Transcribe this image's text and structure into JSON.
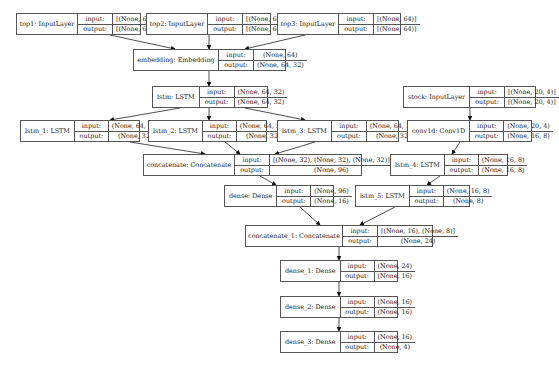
{
  "diagram": {
    "title": "",
    "labels": {
      "input": "input:",
      "output": "output:"
    },
    "nodes": [
      {
        "id": "top1",
        "name": "top1: InputLayer",
        "input": "[(None, 64)]",
        "output": "[(None, 64)]",
        "x": 16,
        "y": 13,
        "w": 125,
        "h": 22,
        "nw": 52,
        "lw": 28
      },
      {
        "id": "top2",
        "name": "top2: InputLayer",
        "input": "[(None, 64)]",
        "output": "[(None, 64)]",
        "x": 146,
        "y": 13,
        "w": 125,
        "h": 22,
        "nw": 52,
        "lw": 28
      },
      {
        "id": "top3",
        "name": "top3: InputLayer",
        "input": "[(None, 64)]",
        "output": "[(None, 64)]",
        "x": 277,
        "y": 13,
        "w": 124,
        "h": 22,
        "nw": 52,
        "lw": 28
      },
      {
        "id": "embedding",
        "name": "embedding: Embedding",
        "input": "(None, 64)",
        "output": "(None, 64, 32)",
        "x": 133,
        "y": 49,
        "w": 153,
        "h": 22,
        "nw": 76,
        "lw": 28
      },
      {
        "id": "lstm",
        "name": "lstm: LSTM",
        "input": "(None, 64, 32)",
        "output": "(None, 64, 32)",
        "x": 152,
        "y": 86,
        "w": 116,
        "h": 22,
        "nw": 39,
        "lw": 28
      },
      {
        "id": "lstm_1",
        "name": "lstm_1: LSTM",
        "input": "(None, 64, 32)",
        "output": "(None, 32)",
        "x": 20,
        "y": 120,
        "w": 120,
        "h": 22,
        "nw": 46,
        "lw": 27
      },
      {
        "id": "lstm_2",
        "name": "lstm_2: LSTM",
        "input": "(None, 64, 32)",
        "output": "(None, 32)",
        "x": 148,
        "y": 120,
        "w": 119,
        "h": 22,
        "nw": 46,
        "lw": 27
      },
      {
        "id": "lstm_3",
        "name": "lstm_3: LSTM",
        "input": "(None, 64, 32)",
        "output": "(None, 32)",
        "x": 277,
        "y": 120,
        "w": 122,
        "h": 22,
        "nw": 46,
        "lw": 28
      },
      {
        "id": "stock",
        "name": "stock: InputLayer",
        "input": "[(None, 20, 4)]",
        "output": "[(None, 20, 4)]",
        "x": 403,
        "y": 86,
        "w": 133,
        "h": 22,
        "nw": 57,
        "lw": 28
      },
      {
        "id": "conv1d",
        "name": "conv1d: Conv1D",
        "input": "(None, 20, 4)",
        "output": "(None, 16, 8)",
        "x": 407,
        "y": 120,
        "w": 125,
        "h": 22,
        "nw": 55,
        "lw": 27
      },
      {
        "id": "concatenate",
        "name": "concatenate: Concatenate",
        "input": "[(None, 32), (None, 32), (None, 32)]",
        "output": "(None, 96)",
        "x": 143,
        "y": 154,
        "w": 219,
        "h": 22,
        "nw": 82,
        "lw": 28
      },
      {
        "id": "lstm_4",
        "name": "lstm_4: LSTM",
        "input": "(None, 16, 8)",
        "output": "(None, 16, 8)",
        "x": 390,
        "y": 154,
        "w": 118,
        "h": 22,
        "nw": 46,
        "lw": 27
      },
      {
        "id": "dense",
        "name": "dense: Dense",
        "input": "(None, 96)",
        "output": "(None, 16)",
        "x": 224,
        "y": 185,
        "w": 110,
        "h": 22,
        "nw": 46,
        "lw": 27
      },
      {
        "id": "lstm_5",
        "name": "lstm_5: LSTM",
        "input": "(None, 16, 8)",
        "output": "(None, 8)",
        "x": 355,
        "y": 185,
        "w": 115,
        "h": 22,
        "nw": 46,
        "lw": 27
      },
      {
        "id": "concatenate_1",
        "name": "concatenate_1: Concatenate",
        "input": "[(None, 16), (None, 8)]",
        "output": "(None, 24)",
        "x": 245,
        "y": 225,
        "w": 188,
        "h": 22,
        "nw": 88,
        "lw": 28
      },
      {
        "id": "dense_1",
        "name": "dense_1: Dense",
        "input": "(None, 24)",
        "output": "(None, 16)",
        "x": 280,
        "y": 260,
        "w": 118,
        "h": 22,
        "nw": 53,
        "lw": 27
      },
      {
        "id": "dense_2",
        "name": "dense_2: Dense",
        "input": "(None, 16)",
        "output": "(None, 16)",
        "x": 280,
        "y": 296,
        "w": 118,
        "h": 22,
        "nw": 53,
        "lw": 27
      },
      {
        "id": "dense_3",
        "name": "dense_3: Dense",
        "input": "(None, 16)",
        "output": "(None, 4)",
        "x": 280,
        "y": 331,
        "w": 118,
        "h": 22,
        "nw": 53,
        "lw": 27
      }
    ],
    "edges": [
      {
        "from": "top1",
        "to": "embedding",
        "x1": 110,
        "y1": 35,
        "x2": 175,
        "y2": 49
      },
      {
        "from": "top2",
        "to": "embedding",
        "x1": 209,
        "y1": 35,
        "x2": 209,
        "y2": 49
      },
      {
        "from": "top3",
        "to": "embedding",
        "x1": 305,
        "y1": 35,
        "x2": 245,
        "y2": 49
      },
      {
        "from": "embedding",
        "to": "lstm",
        "x1": 209,
        "y1": 71,
        "x2": 209,
        "y2": 86
      },
      {
        "from": "lstm",
        "to": "lstm_1",
        "x1": 180,
        "y1": 108,
        "x2": 110,
        "y2": 120
      },
      {
        "from": "lstm",
        "to": "lstm_2",
        "x1": 209,
        "y1": 108,
        "x2": 209,
        "y2": 120
      },
      {
        "from": "lstm",
        "to": "lstm_3",
        "x1": 245,
        "y1": 108,
        "x2": 305,
        "y2": 120
      },
      {
        "from": "lstm_1",
        "to": "concatenate",
        "x1": 130,
        "y1": 142,
        "x2": 205,
        "y2": 154
      },
      {
        "from": "lstm_2",
        "to": "concatenate",
        "x1": 225,
        "y1": 142,
        "x2": 240,
        "y2": 154
      },
      {
        "from": "lstm_3",
        "to": "concatenate",
        "x1": 315,
        "y1": 142,
        "x2": 275,
        "y2": 154
      },
      {
        "from": "stock",
        "to": "conv1d",
        "x1": 470,
        "y1": 108,
        "x2": 470,
        "y2": 120
      },
      {
        "from": "conv1d",
        "to": "lstm_4",
        "x1": 460,
        "y1": 142,
        "x2": 452,
        "y2": 154
      },
      {
        "from": "concatenate",
        "to": "dense",
        "x1": 260,
        "y1": 176,
        "x2": 276,
        "y2": 185
      },
      {
        "from": "lstm_4",
        "to": "lstm_5",
        "x1": 440,
        "y1": 176,
        "x2": 427,
        "y2": 185
      },
      {
        "from": "dense",
        "to": "concatenate_1",
        "x1": 300,
        "y1": 207,
        "x2": 320,
        "y2": 225
      },
      {
        "from": "lstm_5",
        "to": "concatenate_1",
        "x1": 395,
        "y1": 207,
        "x2": 360,
        "y2": 225
      },
      {
        "from": "concatenate_1",
        "to": "dense_1",
        "x1": 339,
        "y1": 247,
        "x2": 339,
        "y2": 260
      },
      {
        "from": "dense_1",
        "to": "dense_2",
        "x1": 339,
        "y1": 282,
        "x2": 339,
        "y2": 296
      },
      {
        "from": "dense_2",
        "to": "dense_3",
        "x1": 339,
        "y1": 318,
        "x2": 339,
        "y2": 331
      }
    ]
  }
}
